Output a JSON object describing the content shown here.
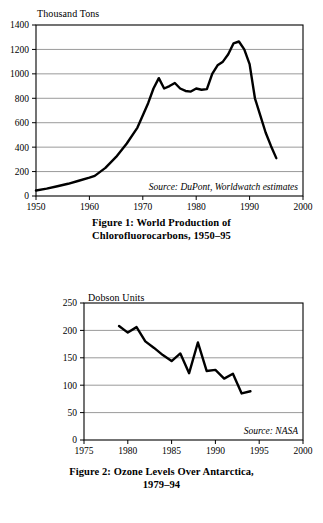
{
  "page": {
    "background": "#ffffff",
    "ink": "#000000",
    "gridline_color": "#808080"
  },
  "figures": [
    {
      "id": "figure-1",
      "caption_line1": "Figure 1: World Production of",
      "caption_line2": "Chlorofluorocarbons, 1950–95",
      "unit_label": "Thousand Tons",
      "source_note": "Source: DuPont, Worldwatch estimates"
    },
    {
      "id": "figure-2",
      "caption_line1": "Figure 2: Ozone Levels Over Antarctica,",
      "caption_line2": "1979–94",
      "unit_label": "Dobson Units",
      "source_note": "Source: NASA"
    }
  ],
  "chart_data": [
    {
      "type": "line",
      "title": "Figure 1: World Production of Chlorofluorocarbons, 1950–95",
      "xlabel": "",
      "ylabel": "Thousand Tons",
      "ylim": [
        0,
        1400
      ],
      "xlim": [
        1950,
        2000
      ],
      "yticks": [
        0,
        200,
        400,
        600,
        800,
        1000,
        1200,
        1400
      ],
      "xticks": [
        1950,
        1960,
        1970,
        1980,
        1990,
        2000
      ],
      "ytick_labels": [
        "0",
        "200",
        "400",
        "600",
        "800",
        "1000",
        "1200",
        "1400"
      ],
      "xtick_labels": [
        "1950",
        "1960",
        "1970",
        "1980",
        "1990",
        "2000"
      ],
      "grid": true,
      "legend": null,
      "annotations": [
        "Source: DuPont, Worldwatch estimates"
      ],
      "x": [
        1950,
        1952,
        1954,
        1956,
        1958,
        1960,
        1961,
        1963,
        1965,
        1967,
        1969,
        1971,
        1972,
        1973,
        1974,
        1975,
        1976,
        1977,
        1978,
        1979,
        1980,
        1981,
        1982,
        1983,
        1984,
        1985,
        1986,
        1987,
        1988,
        1989,
        1990,
        1991,
        1992,
        1993,
        1994,
        1995
      ],
      "y": [
        45,
        60,
        80,
        100,
        125,
        150,
        165,
        230,
        320,
        430,
        560,
        760,
        880,
        965,
        880,
        900,
        925,
        880,
        860,
        855,
        880,
        870,
        875,
        1000,
        1070,
        1100,
        1160,
        1250,
        1265,
        1200,
        1080,
        800,
        660,
        520,
        410,
        310
      ]
    },
    {
      "type": "line",
      "title": "Figure 2: Ozone Levels Over Antarctica, 1979–94",
      "xlabel": "",
      "ylabel": "Dobson Units",
      "ylim": [
        0,
        250
      ],
      "xlim": [
        1975,
        2000
      ],
      "yticks": [
        0,
        50,
        100,
        150,
        200,
        250
      ],
      "xticks": [
        1975,
        1980,
        1985,
        1990,
        1995,
        2000
      ],
      "ytick_labels": [
        "0",
        "50",
        "100",
        "150",
        "200",
        "250"
      ],
      "xtick_labels": [
        "1975",
        "1980",
        "1985",
        "1990",
        "1995",
        "2000"
      ],
      "grid": true,
      "legend": null,
      "annotations": [
        "Source: NASA"
      ],
      "x": [
        1979,
        1980,
        1981,
        1982,
        1983,
        1984,
        1985,
        1986,
        1987,
        1988,
        1989,
        1990,
        1991,
        1992,
        1993,
        1994
      ],
      "y": [
        208,
        196,
        206,
        180,
        168,
        155,
        144,
        158,
        122,
        178,
        126,
        128,
        112,
        121,
        85,
        89
      ]
    }
  ]
}
